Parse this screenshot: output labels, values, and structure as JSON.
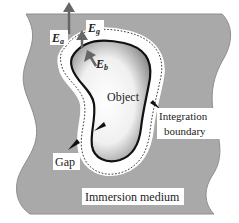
{
  "diagram": {
    "labels": {
      "field_a": {
        "main": "E",
        "sub": "a"
      },
      "field_g": {
        "main": "E",
        "sub": "g"
      },
      "field_b": {
        "main": "E",
        "sub": "b"
      },
      "object": "Object",
      "integration_boundary_line1": "Integration",
      "integration_boundary_line2": "boundary",
      "gap": "Gap",
      "immersion_medium": "Immersion medium"
    },
    "colors": {
      "medium": "#a8a8a8",
      "medium_edge": "#8c8c8c",
      "gap": "#ffffff",
      "object_light": "#ffffff",
      "object_dark": "#8a8a8a",
      "outline": "#111111",
      "arrow": "#666666"
    }
  }
}
